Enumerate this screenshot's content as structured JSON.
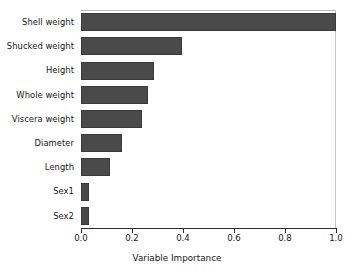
{
  "chart_data": {
    "type": "bar",
    "orientation": "horizontal",
    "title": "",
    "xlabel": "Variable Importance",
    "ylabel": "",
    "categories": [
      "Shell weight",
      "Shucked weight",
      "Height",
      "Whole weight",
      "Viscera weight",
      "Diameter",
      "Length",
      "Sex1",
      "Sex2"
    ],
    "values": [
      1.0,
      0.395,
      0.285,
      0.263,
      0.238,
      0.16,
      0.113,
      0.033,
      0.033
    ],
    "xlim": [
      0.0,
      1.0
    ],
    "xticks": [
      0.0,
      0.2,
      0.4,
      0.6,
      0.8,
      1.0
    ],
    "xtick_labels": [
      "0.0",
      "0.2",
      "0.4",
      "0.6",
      "0.8",
      "1.0"
    ],
    "grid": false,
    "legend": "none",
    "bar_color": "#4a4a4a",
    "background_color": "#ffffff",
    "axis_color": "#2b2b2b"
  }
}
